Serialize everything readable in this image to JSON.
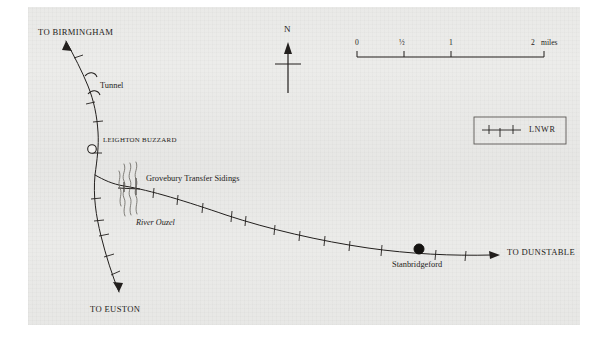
{
  "map": {
    "title": "Leighton Buzzard to Dunstable branch railway map",
    "sheet": {
      "background_color": "#ececea",
      "border_color": "#ffffff"
    },
    "ink_color": "#221f1d",
    "labels": {
      "to_birmingham": "TO BIRMINGHAM",
      "tunnel": "Tunnel",
      "leighton_buzzard": "LEIGHTON BUZZARD",
      "grovebury_transfer_sidings": "Grovebury Transfer Sidings",
      "river_ouzel": "River Ouzel",
      "stanbridgeford": "Stanbridgeford",
      "to_dunstable": "TO DUNSTABLE",
      "to_euston": "TO EUSTON"
    },
    "compass": {
      "north_label": "N"
    },
    "scale_bar": {
      "ticks": [
        {
          "label": "0",
          "position_miles": 0
        },
        {
          "label": "½",
          "position_miles": 0.5
        },
        {
          "label": "1",
          "position_miles": 1
        },
        {
          "label": "2",
          "position_miles": 2
        }
      ],
      "units_label": "miles",
      "max_miles": 2
    },
    "legend": {
      "entries": [
        {
          "label": "LNWR",
          "symbol": "railway-line-with-ticks"
        }
      ]
    },
    "stations": [
      {
        "name": "LEIGHTON BUZZARD",
        "marker": "open-circle"
      },
      {
        "name": "Stanbridgeford",
        "marker": "filled-circle"
      }
    ]
  }
}
